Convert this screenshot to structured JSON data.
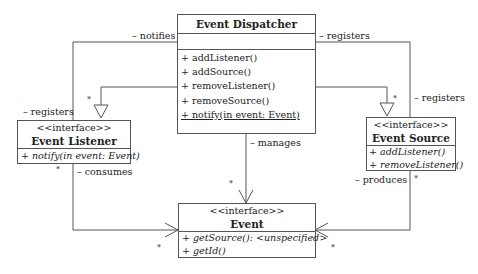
{
  "diagram": {
    "type": "uml-class-diagram",
    "classes": {
      "dispatcher": {
        "name": "Event Dispatcher",
        "stereotype": "",
        "methods": [
          "+ addListener()",
          "+ addSource()",
          "+ removeListener()",
          "+ removeSource()",
          "+ notify(in event: Event)"
        ]
      },
      "listener": {
        "name": "Event Listener",
        "stereotype": "<<interface>>",
        "methods": [
          "+ notify(in event: Event)"
        ]
      },
      "source": {
        "name": "Event Source",
        "stereotype": "<<interface>>",
        "methods": [
          "+ addListener()",
          "+ removeListener()"
        ]
      },
      "event": {
        "name": "Event",
        "stereotype": "<<interface>>",
        "methods": [
          "+ getSource(): <unspecified>",
          "+ getId()"
        ]
      }
    },
    "labels": {
      "notifies": "– notifies",
      "registers_left": "– registers",
      "registers_top_right": "– registers",
      "registers_right": "– registers",
      "manages": "– manages",
      "consumes": "– consumes",
      "produces": "– produces"
    },
    "multiplicity": "*",
    "colors": {
      "line": "#555555",
      "text": "#222222",
      "background": "#ffffff"
    }
  }
}
